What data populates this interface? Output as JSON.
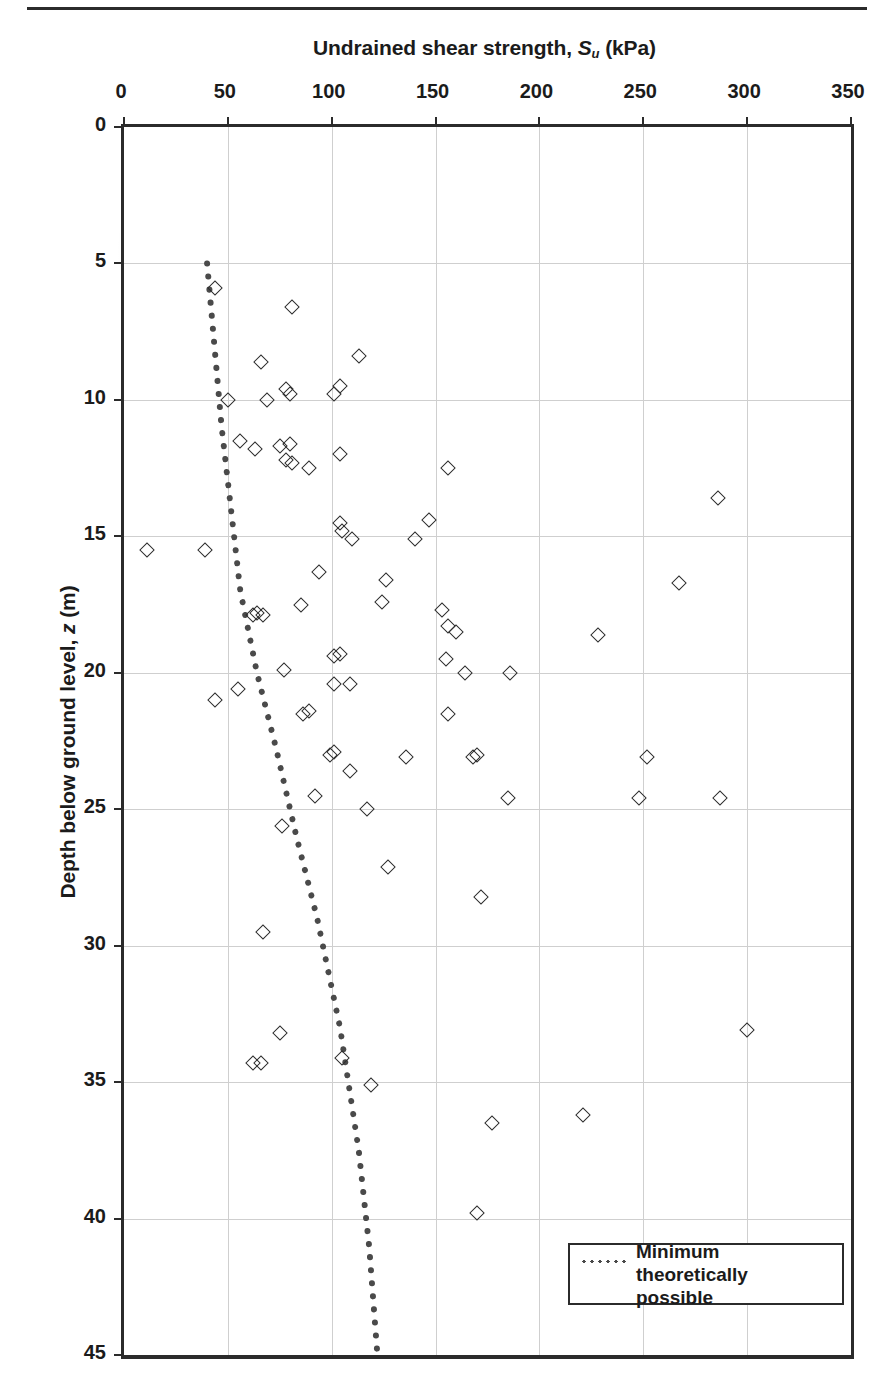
{
  "chart_data": {
    "type": "scatter",
    "title": "",
    "xlabel": "Undrained shear strength, S_u (kPa)",
    "xlabel_parts": {
      "pre": "Undrained shear strength, ",
      "sym": "S",
      "sub": "u",
      "post": " (kPa)"
    },
    "ylabel": "Depth below ground level, z (m)",
    "ylabel_parts": {
      "pre": "Depth below ground level, ",
      "sym": "z",
      "post": " (m)"
    },
    "xlim": [
      0,
      350
    ],
    "ylim": [
      0,
      45
    ],
    "y_inverted": true,
    "grid": true,
    "xticks": [
      0,
      50,
      100,
      150,
      200,
      250,
      300,
      350
    ],
    "yticks": [
      0,
      5,
      10,
      15,
      20,
      25,
      30,
      35,
      40,
      45
    ],
    "xtick_labels": [
      "0",
      "50",
      "100",
      "150",
      "200",
      "250",
      "300",
      "350"
    ],
    "ytick_labels": [
      "0",
      "5",
      "10",
      "15",
      "20",
      "25",
      "30",
      "35",
      "40",
      "45"
    ],
    "legend_position": "bottom-right",
    "series": [
      {
        "name": "Undrained shear strength data",
        "marker": "open-diamond",
        "color": "#2e2e2e",
        "points": [
          [
            44,
            5.9
          ],
          [
            81,
            6.6
          ],
          [
            66,
            8.6
          ],
          [
            113,
            8.4
          ],
          [
            50,
            10.0
          ],
          [
            69,
            10.0
          ],
          [
            78,
            9.6
          ],
          [
            80,
            9.8
          ],
          [
            101,
            9.8
          ],
          [
            104,
            9.5
          ],
          [
            56,
            11.5
          ],
          [
            63,
            11.8
          ],
          [
            75,
            11.7
          ],
          [
            80,
            11.6
          ],
          [
            78,
            12.2
          ],
          [
            81,
            12.3
          ],
          [
            89,
            12.5
          ],
          [
            104,
            12.0
          ],
          [
            156,
            12.5
          ],
          [
            286,
            13.6
          ],
          [
            11,
            15.5
          ],
          [
            39,
            15.5
          ],
          [
            104,
            14.5
          ],
          [
            105,
            14.8
          ],
          [
            110,
            15.1
          ],
          [
            140,
            15.1
          ],
          [
            147,
            14.4
          ],
          [
            94,
            16.3
          ],
          [
            126,
            16.6
          ],
          [
            62,
            17.9
          ],
          [
            64,
            17.8
          ],
          [
            67,
            17.9
          ],
          [
            85,
            17.5
          ],
          [
            124,
            17.4
          ],
          [
            153,
            17.7
          ],
          [
            267,
            16.7
          ],
          [
            156,
            18.3
          ],
          [
            160,
            18.5
          ],
          [
            228,
            18.6
          ],
          [
            101,
            19.4
          ],
          [
            104,
            19.3
          ],
          [
            77,
            19.9
          ],
          [
            155,
            19.5
          ],
          [
            164,
            20.0
          ],
          [
            186,
            20.0
          ],
          [
            44,
            21.0
          ],
          [
            55,
            20.6
          ],
          [
            101,
            20.4
          ],
          [
            109,
            20.4
          ],
          [
            86,
            21.5
          ],
          [
            89,
            21.4
          ],
          [
            156,
            21.5
          ],
          [
            99,
            23.0
          ],
          [
            101,
            22.9
          ],
          [
            109,
            23.6
          ],
          [
            136,
            23.1
          ],
          [
            168,
            23.1
          ],
          [
            170,
            23.0
          ],
          [
            252,
            23.1
          ],
          [
            76,
            25.6
          ],
          [
            92,
            24.5
          ],
          [
            117,
            25.0
          ],
          [
            185,
            24.6
          ],
          [
            248,
            24.6
          ],
          [
            287,
            24.6
          ],
          [
            127,
            27.1
          ],
          [
            172,
            28.2
          ],
          [
            67,
            29.5
          ],
          [
            75,
            33.2
          ],
          [
            62,
            34.3
          ],
          [
            66,
            34.3
          ],
          [
            105,
            34.1
          ],
          [
            300,
            33.1
          ],
          [
            119,
            35.1
          ],
          [
            177,
            36.5
          ],
          [
            221,
            36.2
          ],
          [
            170,
            39.8
          ]
        ]
      }
    ],
    "reference_line": {
      "name": "Minimum theoretically possible",
      "style": "dotted",
      "color": "#4a4a4a",
      "points": [
        [
          40,
          5.0
        ],
        [
          47,
          11.0
        ],
        [
          56,
          17.0
        ],
        [
          64,
          20.0
        ],
        [
          73,
          22.7
        ],
        [
          83,
          26.0
        ],
        [
          93,
          29.0
        ],
        [
          104,
          33.0
        ],
        [
          113,
          37.5
        ],
        [
          118,
          41.0
        ],
        [
          122,
          45.0
        ]
      ]
    },
    "legend": [
      {
        "label_line1": "Minimum theoretically",
        "label_line2": "possible",
        "marker": "dotted-line"
      }
    ]
  }
}
